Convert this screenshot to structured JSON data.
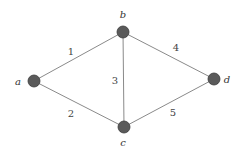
{
  "graph": {
    "nodes": [
      {
        "id": "a",
        "label": "a",
        "x": 34,
        "y": 81,
        "lx": 18,
        "ly": 85
      },
      {
        "id": "b",
        "label": "b",
        "x": 123,
        "y": 32,
        "lx": 123,
        "ly": 18
      },
      {
        "id": "c",
        "label": "c",
        "x": 124,
        "y": 127,
        "lx": 123,
        "ly": 146
      },
      {
        "id": "d",
        "label": "d",
        "x": 214,
        "y": 79,
        "lx": 227,
        "ly": 83
      }
    ],
    "edges": [
      {
        "from": "a",
        "to": "b",
        "label": "1",
        "lx": 71,
        "ly": 55
      },
      {
        "from": "a",
        "to": "c",
        "label": "2",
        "lx": 71,
        "ly": 117
      },
      {
        "from": "b",
        "to": "c",
        "label": "3",
        "lx": 115,
        "ly": 84
      },
      {
        "from": "b",
        "to": "d",
        "label": "4",
        "lx": 176,
        "ly": 51
      },
      {
        "from": "c",
        "to": "d",
        "label": "5",
        "lx": 173,
        "ly": 116
      }
    ]
  }
}
